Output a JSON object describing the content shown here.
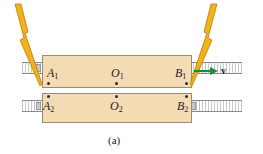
{
  "figure": {
    "caption": "(a)",
    "velocity_label": "v",
    "colors": {
      "train_fill": "#f3dcb4",
      "train_border": "#9c8a70",
      "lightning": "#f2b21a",
      "arrow": "#1f8a3a"
    }
  },
  "train_top": {
    "points": [
      {
        "name": "A",
        "sub": "1"
      },
      {
        "name": "O",
        "sub": "1"
      },
      {
        "name": "B",
        "sub": "1"
      }
    ]
  },
  "train_bottom": {
    "points": [
      {
        "name": "A",
        "sub": "2"
      },
      {
        "name": "O",
        "sub": "2"
      },
      {
        "name": "B",
        "sub": "2"
      }
    ]
  },
  "icons": {
    "lightning_left": "lightning-bolt-icon",
    "lightning_right": "lightning-bolt-icon",
    "velocity_arrow": "arrow-right-icon"
  }
}
